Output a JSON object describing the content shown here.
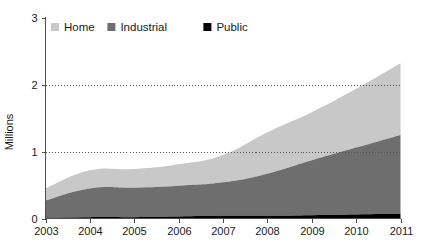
{
  "chart_data": {
    "type": "area",
    "stacked": true,
    "title": "",
    "xlabel": "",
    "ylabel": "Millions",
    "categories": [
      "2003",
      "2004",
      "2005",
      "2006",
      "2007",
      "2008",
      "2009",
      "2010",
      "2011"
    ],
    "x": [
      2003,
      2004,
      2005,
      2006,
      2007,
      2008,
      2009,
      2010,
      2011
    ],
    "xlim": [
      2003,
      2011
    ],
    "ylim": [
      0,
      3
    ],
    "yticks": [
      0,
      1,
      2,
      3
    ],
    "ytick_labels": [
      "0",
      "1",
      "2",
      "3"
    ],
    "xtick_labels": [
      "2003",
      "2004",
      "2005",
      "2006",
      "2007",
      "2008",
      "2009",
      "2010",
      "2011"
    ],
    "grid": "horizontal-dotted-at-1-and-2",
    "legend_position": "top-left-inside",
    "series": [
      {
        "name": "Public",
        "color": "#000000",
        "values": [
          0.01,
          0.02,
          0.02,
          0.03,
          0.04,
          0.04,
          0.05,
          0.06,
          0.07
        ]
      },
      {
        "name": "Industrial",
        "color": "#6e6e6e",
        "values": [
          0.26,
          0.43,
          0.44,
          0.46,
          0.5,
          0.63,
          0.82,
          1.0,
          1.18
        ]
      },
      {
        "name": "Home",
        "color": "#c8c8c8",
        "values": [
          0.18,
          0.27,
          0.28,
          0.32,
          0.41,
          0.62,
          0.72,
          0.88,
          1.07
        ]
      }
    ],
    "cumulative_totals": [
      0.45,
      0.72,
      0.74,
      0.81,
      0.95,
      1.29,
      1.59,
      1.94,
      2.32
    ]
  },
  "legend": {
    "items": [
      {
        "label": "Home",
        "color": "#c8c8c8"
      },
      {
        "label": "Industrial",
        "color": "#6e6e6e"
      },
      {
        "label": "Public",
        "color": "#000000"
      }
    ]
  },
  "axes": {
    "y_axis_title": "Millions",
    "y_ticks": [
      "3",
      "2",
      "1",
      "0"
    ],
    "x_ticks": [
      "2003",
      "2004",
      "2005",
      "2006",
      "2007",
      "2008",
      "2009",
      "2010",
      "2011"
    ]
  },
  "colors": {
    "home": "#c8c8c8",
    "industrial": "#6e6e6e",
    "public": "#000000",
    "axis": "#4d4d4d",
    "text": "#1a1a1a",
    "background": "#ffffff"
  }
}
